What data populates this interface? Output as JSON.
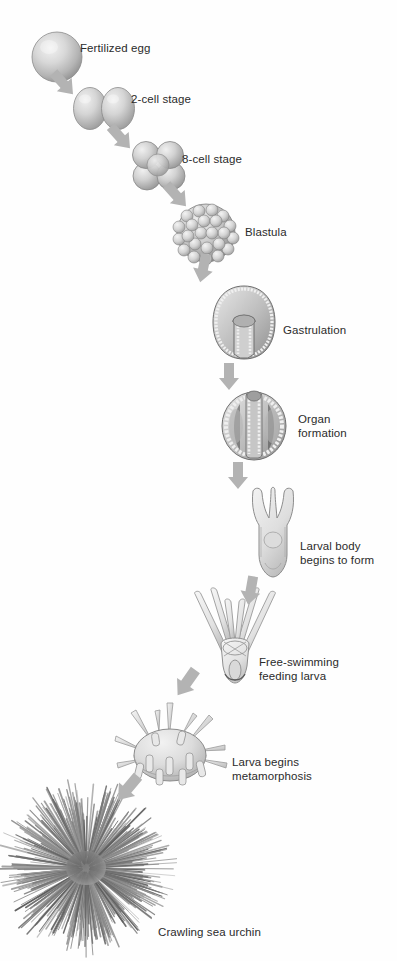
{
  "figure": {
    "background_color": "#fefefe",
    "arrow_color": "#b3b3b3",
    "text_color": "#2b2b2b",
    "cell_fill_light": "#e2e2e2",
    "cell_fill_mid": "#bdbdbd",
    "cell_fill_dark": "#8f8f8f",
    "outline_color": "#6e6e6e"
  },
  "stages": [
    {
      "id": "fertilized-egg",
      "label": "Fertilized egg",
      "order": 1,
      "label_x": 80,
      "label_y": 41,
      "art_x": 31,
      "art_y": 31,
      "art_w": 52,
      "art_h": 52
    },
    {
      "id": "two-cell-stage",
      "label": "2-cell stage",
      "order": 2,
      "label_x": 131,
      "label_y": 92,
      "art_x": 73,
      "art_y": 87,
      "art_w": 62,
      "art_h": 43
    },
    {
      "id": "eight-cell-stage",
      "label": "8-cell stage",
      "order": 3,
      "label_x": 182,
      "label_y": 152,
      "art_x": 131,
      "art_y": 140,
      "art_w": 56,
      "art_h": 52
    },
    {
      "id": "blastula",
      "label": "Blastula",
      "order": 4,
      "label_x": 245,
      "label_y": 225,
      "art_x": 171,
      "art_y": 203,
      "art_w": 70,
      "art_h": 60
    },
    {
      "id": "gastrulation",
      "label": "Gastrulation",
      "order": 5,
      "label_x": 283,
      "label_y": 323,
      "art_x": 210,
      "art_y": 284,
      "art_w": 68,
      "art_h": 78
    },
    {
      "id": "organ-formation",
      "label": "Organ\nformation",
      "order": 6,
      "label_x": 298,
      "label_y": 412,
      "art_x": 220,
      "art_y": 388,
      "art_w": 68,
      "art_h": 74
    },
    {
      "id": "larval-body",
      "label": "Larval body\nbegins to form",
      "order": 7,
      "label_x": 300,
      "label_y": 539,
      "art_x": 245,
      "art_y": 485,
      "art_w": 56,
      "art_h": 93
    },
    {
      "id": "free-swimming-larva",
      "label": "Free-swimming\nfeeding larva",
      "order": 8,
      "label_x": 259,
      "label_y": 655,
      "art_x": 191,
      "art_y": 586,
      "art_w": 88,
      "art_h": 98
    },
    {
      "id": "larva-metamorphosis",
      "label": "Larva begins\nmetamorphosis",
      "order": 9,
      "label_x": 232,
      "label_y": 755,
      "art_x": 109,
      "art_y": 697,
      "art_w": 122,
      "art_h": 94
    },
    {
      "id": "crawling-sea-urchin",
      "label": "Crawling sea urchin",
      "order": 10,
      "label_x": 158,
      "label_y": 925,
      "art_x": 12,
      "art_y": 796,
      "art_w": 152,
      "art_h": 152
    }
  ],
  "arrows": [
    {
      "id": "arrow-egg-to-2cell",
      "x": 61,
      "y": 66,
      "rotate": 48
    },
    {
      "id": "arrow-2cell-to-8cell",
      "x": 118,
      "y": 120,
      "rotate": 48
    },
    {
      "id": "arrow-8cell-to-blastula",
      "x": 174,
      "y": 178,
      "rotate": 48
    },
    {
      "id": "arrow-blastula-to-gastrula",
      "x": 216,
      "y": 256,
      "rotate": 12
    },
    {
      "id": "arrow-gastrula-to-organ",
      "x": 245,
      "y": 360,
      "rotate": 0
    },
    {
      "id": "arrow-organ-to-larval",
      "x": 253,
      "y": 460,
      "rotate": 0
    },
    {
      "id": "arrow-larval-to-swimming",
      "x": 245,
      "y": 572,
      "rotate": 5
    },
    {
      "id": "arrow-swimming-to-meta",
      "x": 200,
      "y": 672,
      "rotate": 35
    },
    {
      "id": "arrow-meta-to-urchin",
      "x": 140,
      "y": 780,
      "rotate": 40
    }
  ]
}
